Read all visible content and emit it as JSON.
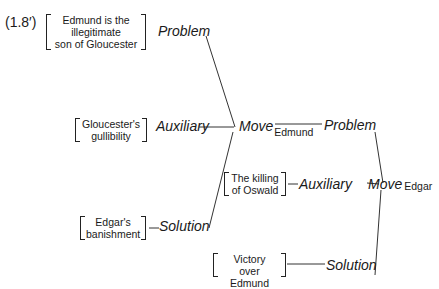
{
  "figure": {
    "label": "(1.8′)",
    "left_tree": {
      "problem": {
        "label": "Problem",
        "content": [
          "Edmund is the",
          "illegitimate",
          "son of Gloucester"
        ]
      },
      "auxiliary": {
        "label": "Auxiliary",
        "content": [
          "Gloucester's",
          "gullibility"
        ]
      },
      "move": {
        "label": "Move",
        "subscript": "Edmund"
      },
      "solution": {
        "label": "Solution",
        "content": [
          "Edgar's",
          "banishment"
        ]
      }
    },
    "right_tree": {
      "problem": {
        "label": "Problem"
      },
      "auxiliary": {
        "label": "Auxiliary",
        "content": [
          "The killing",
          "of Oswald"
        ]
      },
      "move": {
        "label": "Move",
        "subscript": "Edgar"
      },
      "solution": {
        "label": "Solution",
        "content": [
          "Victory",
          "over Edmund"
        ]
      }
    }
  }
}
